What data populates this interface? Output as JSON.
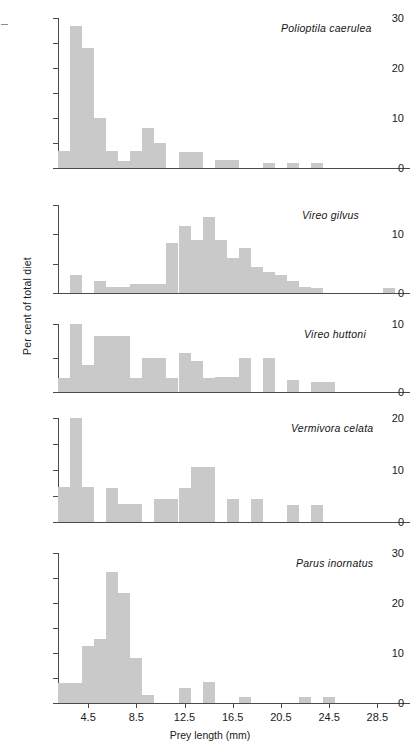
{
  "figure": {
    "ylabel": "Per cent of total diet",
    "xlabel": "Prey length (mm)",
    "bar_color": "#c9c9c9",
    "axis_color": "#4a4a4a",
    "xticks": [
      "4.5",
      "8.5",
      "12.5",
      "16.5",
      "20.5",
      "24.5",
      "28.5"
    ]
  },
  "chart_data": {
    "type": "bar",
    "title": "",
    "xlabel": "Prey length (mm)",
    "ylabel": "Per cent of total diet",
    "xlim": [
      1.5,
      30.5
    ],
    "bin_width": 1,
    "grid": false,
    "legend": "none",
    "panels": [
      {
        "species": "Polioptila caerulea",
        "ylim": [
          0,
          30
        ],
        "yticks": [
          0,
          5,
          10,
          15,
          20,
          25,
          30
        ],
        "ytick_labels": [
          "0",
          "",
          "10",
          "",
          "20",
          "",
          "30"
        ],
        "x": [
          2.5,
          3.5,
          4.5,
          5.5,
          6.5,
          7.5,
          8.5,
          9.5,
          10.5,
          11.5,
          12.5,
          13.5,
          14.5,
          15.5,
          16.5,
          17.5,
          18.5,
          19.5,
          20.5,
          21.5,
          22.5,
          23.5,
          24.5,
          25.5,
          26.5,
          27.5,
          28.5,
          29.5
        ],
        "values": [
          3.5,
          28.5,
          24,
          10,
          3.5,
          1.5,
          3.5,
          8,
          5,
          0,
          3.3,
          3.3,
          0,
          1.7,
          1.7,
          0,
          0,
          1,
          0,
          1,
          0,
          1,
          0,
          0,
          0,
          0,
          0,
          0
        ]
      },
      {
        "species": "Vireo gilvus",
        "ylim": [
          0,
          15
        ],
        "yticks": [
          0,
          5,
          10,
          15
        ],
        "ytick_labels": [
          "0",
          "",
          "10",
          ""
        ],
        "x": [
          2.5,
          3.5,
          4.5,
          5.5,
          6.5,
          7.5,
          8.5,
          9.5,
          10.5,
          11.5,
          12.5,
          13.5,
          14.5,
          15.5,
          16.5,
          17.5,
          18.5,
          19.5,
          20.5,
          21.5,
          22.5,
          23.5,
          24.5,
          25.5,
          26.5,
          27.5,
          28.5,
          29.5
        ],
        "values": [
          0,
          3,
          0,
          2,
          1,
          1,
          1.5,
          1.5,
          1.5,
          8.5,
          11.5,
          9,
          13,
          9,
          6,
          7.7,
          4.5,
          3.5,
          3,
          2,
          1,
          0.8,
          0,
          0,
          0,
          0,
          0,
          0.8
        ]
      },
      {
        "species": "Vireo huttoni",
        "ylim": [
          0,
          10
        ],
        "yticks": [
          0,
          5,
          10
        ],
        "ytick_labels": [
          "0",
          "",
          "10"
        ],
        "x": [
          2.5,
          3.5,
          4.5,
          5.5,
          6.5,
          7.5,
          8.5,
          9.5,
          10.5,
          11.5,
          12.5,
          13.5,
          14.5,
          15.5,
          16.5,
          17.5,
          18.5,
          19.5,
          20.5,
          21.5,
          22.5,
          23.5,
          24.5,
          25.5,
          26.5,
          27.5,
          28.5,
          29.5
        ],
        "values": [
          2,
          10,
          4,
          8.3,
          8.3,
          8.3,
          2,
          5,
          5,
          2,
          5.8,
          4.5,
          2,
          2.2,
          2.2,
          5,
          0,
          5,
          0,
          1.8,
          0,
          1.5,
          1.5,
          0,
          0,
          0,
          0,
          0
        ]
      },
      {
        "species": "Vermivora celata",
        "ylim": [
          0,
          20
        ],
        "yticks": [
          0,
          5,
          10,
          15,
          20
        ],
        "ytick_labels": [
          "0",
          "",
          "10",
          "",
          "20"
        ],
        "x": [
          2.5,
          3.5,
          4.5,
          5.5,
          6.5,
          7.5,
          8.5,
          9.5,
          10.5,
          11.5,
          12.5,
          13.5,
          14.5,
          15.5,
          16.5,
          17.5,
          18.5,
          19.5,
          20.5,
          21.5,
          22.5,
          23.5,
          24.5,
          25.5,
          26.5,
          27.5,
          28.5,
          29.5
        ],
        "values": [
          6.8,
          20,
          6.8,
          0,
          6.5,
          3.5,
          3.5,
          0,
          4.5,
          4.5,
          6.5,
          10.5,
          10.5,
          0,
          4.5,
          0,
          4.5,
          0,
          0,
          3.3,
          0,
          3.2,
          0,
          0,
          0,
          0,
          0,
          0
        ]
      },
      {
        "species": "Parus inornatus",
        "ylim": [
          0,
          30
        ],
        "yticks": [
          0,
          5,
          10,
          15,
          20,
          25,
          30
        ],
        "ytick_labels": [
          "0",
          "",
          "10",
          "",
          "20",
          "",
          "30"
        ],
        "x": [
          2.5,
          3.5,
          4.5,
          5.5,
          6.5,
          7.5,
          8.5,
          9.5,
          10.5,
          11.5,
          12.5,
          13.5,
          14.5,
          15.5,
          16.5,
          17.5,
          18.5,
          19.5,
          20.5,
          21.5,
          22.5,
          23.5,
          24.5,
          25.5,
          26.5,
          27.5,
          28.5,
          29.5
        ],
        "values": [
          4,
          4,
          11.5,
          12.8,
          26.3,
          22,
          9,
          1.7,
          0,
          0,
          3,
          0,
          4.2,
          0,
          0,
          1.3,
          0,
          0,
          0,
          0,
          1.2,
          0,
          1.2,
          0,
          0,
          0,
          0,
          0
        ]
      }
    ]
  }
}
